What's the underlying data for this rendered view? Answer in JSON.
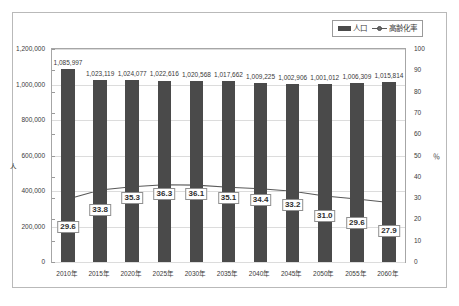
{
  "chart_data": {
    "type": "bar",
    "title": "",
    "xlabel": "",
    "ylabel": "人",
    "y2label": "％",
    "grid": true,
    "legend_position": "top-right",
    "categories": [
      "2010年",
      "2015年",
      "2020年",
      "2025年",
      "2030年",
      "2035年",
      "2040年",
      "2045年",
      "2050年",
      "2055年",
      "2060年"
    ],
    "ylim": [
      0,
      1200000
    ],
    "yticks": [
      0,
      200000,
      400000,
      600000,
      800000,
      1000000,
      1200000
    ],
    "ytick_labels": [
      "0",
      "200,000",
      "400,000",
      "600,000",
      "800,000",
      "1,000,000",
      "1,200,000"
    ],
    "y2lim": [
      0,
      100
    ],
    "y2ticks": [
      0,
      10,
      20,
      30,
      40,
      50,
      60,
      70,
      80,
      90,
      100
    ],
    "y2tick_labels": [
      "0",
      "10",
      "20",
      "30",
      "40",
      "50",
      "60",
      "70",
      "80",
      "90",
      "100"
    ],
    "series": [
      {
        "name": "人口",
        "type": "bar",
        "axis": "left",
        "color": "#4a4a4a",
        "values": [
          1085997,
          1023119,
          1024077,
          1022616,
          1020568,
          1017662,
          1009225,
          1002906,
          1001012,
          1006309,
          1015814
        ],
        "labels": [
          "1,085,997",
          "1,023,119",
          "1,024,077",
          "1,022,616",
          "1,020,568",
          "1,017,662",
          "1,009,225",
          "1,002,906",
          "1,001,012",
          "1,006,309",
          "1,015,814"
        ]
      },
      {
        "name": "高齢化率",
        "type": "line",
        "axis": "right",
        "color": "#595959",
        "values": [
          29.6,
          33.8,
          35.3,
          36.3,
          36.1,
          35.1,
          34.4,
          33.2,
          31.0,
          29.6,
          27.9
        ],
        "labels": [
          "29.6",
          "33.8",
          "35.3",
          "36.3",
          "36.1",
          "35.1",
          "34.4",
          "33.2",
          "31.0",
          "29.6",
          "27.9"
        ]
      }
    ]
  },
  "legend": {
    "items": [
      {
        "label": "人口",
        "marker": "bar-swatch"
      },
      {
        "label": "高齢化率",
        "marker": "line-marker"
      }
    ]
  },
  "axes": {
    "left_unit": "人",
    "right_unit": "％"
  },
  "caption": ""
}
